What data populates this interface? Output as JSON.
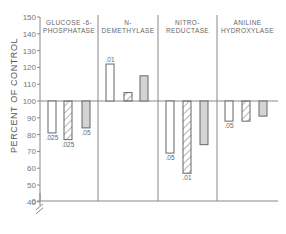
{
  "chart_data": {
    "type": "bar",
    "title": "",
    "xlabel": "",
    "ylabel": "PERCENT OF CONTROL",
    "ylim": [
      0,
      150
    ],
    "yticks": [
      0,
      40,
      50,
      60,
      70,
      80,
      90,
      100,
      110,
      120,
      130,
      140,
      150
    ],
    "axis_break": "between 0 and 40",
    "baseline": 100,
    "grid": false,
    "legend": "none",
    "categories": [
      "GLUCOSE-6-PHOSPHATASE",
      "N-DEMETHYLASE",
      "NITRO-REDUCTASE",
      "ANILINE HYDROXYLASE"
    ],
    "panel_labels": [
      [
        "GLUCOSE -6-",
        "PHOSPHATASE"
      ],
      [
        "N-",
        "DEMETHYLASE"
      ],
      [
        "NITRO-",
        "REDUCTASE"
      ],
      [
        "ANILINE",
        "HYDROXYLASE"
      ]
    ],
    "series": [
      {
        "name": "open",
        "style": "open",
        "values": [
          81,
          122,
          69,
          88
        ],
        "annotations": [
          ".025",
          ".01",
          ".05",
          ".05"
        ]
      },
      {
        "name": "hatched",
        "style": "hatched",
        "values": [
          77,
          105,
          57,
          88
        ],
        "annotations": [
          ".025",
          "",
          ".01",
          ""
        ]
      },
      {
        "name": "shaded",
        "style": "shaded",
        "values": [
          84,
          115,
          74,
          91
        ],
        "annotations": [
          ".05",
          "",
          "",
          ""
        ]
      }
    ]
  },
  "colors": {
    "axis": "#888888",
    "bar_edge": "#666666",
    "shaded_fill": "#d4d4d4",
    "open_fill": "#ffffff",
    "hatch": "#777777"
  }
}
